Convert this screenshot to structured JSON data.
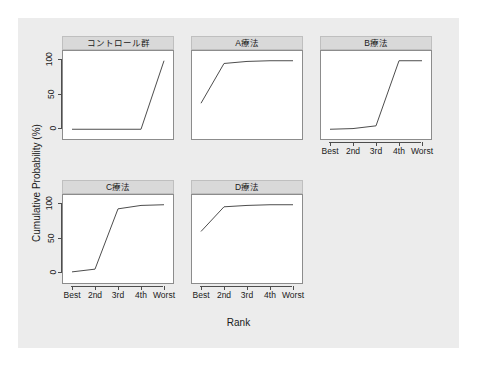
{
  "figure": {
    "background_color": "#ececec",
    "panel_background_color": "#ffffff",
    "strip_background_color": "#d9d9d9",
    "line_color": "#4d4d4d"
  },
  "chart_data": {
    "type": "line",
    "title": "",
    "xlabel": "Rank",
    "ylabel": "Cumulative Probability (%)",
    "categories": [
      "Best",
      "2nd",
      "3rd",
      "4th",
      "Worst"
    ],
    "xticklabels": [
      "Best",
      "2nd",
      "3rd",
      "4th",
      "Worst"
    ],
    "yticklabels": [
      "0",
      "50",
      "100"
    ],
    "yticks": [
      0,
      50,
      100
    ],
    "ylim": [
      -4,
      104
    ],
    "grid": false,
    "legend": "none",
    "layout": "facet 3 columns x 2 rows",
    "panels": [
      {
        "id": "control",
        "title": "コントロール群",
        "row": 0,
        "col": 0,
        "values": [
          0,
          0,
          0,
          0,
          100
        ]
      },
      {
        "id": "therapy-a",
        "title": "A療法",
        "row": 0,
        "col": 1,
        "values": [
          38,
          96,
          99,
          100,
          100
        ]
      },
      {
        "id": "therapy-b",
        "title": "B療法",
        "row": 0,
        "col": 2,
        "values": [
          0,
          1,
          5,
          100,
          100
        ]
      },
      {
        "id": "therapy-c",
        "title": "C療法",
        "row": 1,
        "col": 0,
        "values": [
          2,
          6,
          94,
          99,
          100
        ]
      },
      {
        "id": "therapy-d",
        "title": "D療法",
        "row": 1,
        "col": 1,
        "values": [
          61,
          97,
          99,
          100,
          100
        ]
      }
    ]
  }
}
